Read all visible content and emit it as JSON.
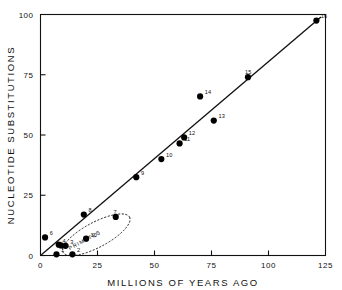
{
  "chart_data": {
    "type": "scatter",
    "title": "",
    "xlabel": "MILLIONS OF YEARS AGO",
    "ylabel": "NUCLEOTIDE SUBSTITUTIONS",
    "xlim": [
      0,
      125
    ],
    "ylim": [
      0,
      100
    ],
    "xticks": [
      0,
      25,
      50,
      75,
      100,
      125
    ],
    "yticks": [
      0,
      25,
      50,
      75,
      100
    ],
    "xtick_labels": [
      "0",
      "25",
      "50",
      "75",
      "100",
      "125"
    ],
    "ytick_labels": [
      "0",
      "25",
      "50",
      "75",
      "100"
    ],
    "grid": false,
    "legend": "none",
    "points": [
      {
        "label": "1",
        "x": 7,
        "y": 0.5,
        "label_dx": 3.0,
        "label_dy": -2.0
      },
      {
        "label": "2",
        "x": 14,
        "y": 0.5,
        "label_dx": 3.0,
        "label_dy": -2.0
      },
      {
        "label": "3",
        "x": 11,
        "y": 4.0,
        "label_dx": 3.0,
        "label_dy": -1.5
      },
      {
        "label": "4",
        "x": 8,
        "y": 4.5,
        "label_dx": 2.5,
        "label_dy": -2.0
      },
      {
        "label": "5",
        "x": 9,
        "y": 4.2,
        "label_dx": 2.5,
        "label_dy": 2.6
      },
      {
        "label": "6",
        "x": 2,
        "y": 7.5,
        "label_dx": 3.0,
        "label_dy": -2.2
      },
      {
        "label": "7",
        "x": 33,
        "y": 16.0,
        "label_dx": -1.5,
        "label_dy": -3.0
      },
      {
        "label": "8",
        "x": 19,
        "y": 17.0,
        "label_dx": 3.0,
        "label_dy": -2.4
      },
      {
        "label": "9",
        "x": 42,
        "y": 32.5,
        "label_dx": 3.0,
        "label_dy": -2.4
      },
      {
        "label": "10",
        "x": 53,
        "y": 40.0,
        "label_dx": 3.0,
        "label_dy": -2.4
      },
      {
        "label": "11",
        "x": 61,
        "y": 46.5,
        "label_dx": 3.0,
        "label_dy": -2.4
      },
      {
        "label": "12",
        "x": 63,
        "y": 49.0,
        "label_dx": 3.0,
        "label_dy": -2.4
      },
      {
        "label": "13",
        "x": 76,
        "y": 56.0,
        "label_dx": 3.0,
        "label_dy": -2.4
      },
      {
        "label": "14",
        "x": 70,
        "y": 66.0,
        "label_dx": 3.0,
        "label_dy": -2.4
      },
      {
        "label": "15",
        "x": 91,
        "y": 74.0,
        "label_dx": -2.0,
        "label_dy": -3.2
      },
      {
        "label": "16",
        "x": 121,
        "y": 97.5,
        "label_dx": 2.8,
        "label_dy": -2.2
      },
      {
        "label": "10",
        "x": 20,
        "y": 7.0,
        "label_dx": 2.8,
        "label_dy": -1.8
      }
    ],
    "regression_line": {
      "x0": 0,
      "y0": 0,
      "x1": 123,
      "y1": 99,
      "description": "linear fit through origin"
    },
    "annotations": [
      {
        "text": "PRIMATES",
        "type": "dashed-ellipse-group",
        "center_x": 24.5,
        "center_y": 8.6,
        "rx": 16.5,
        "ry": 5.2,
        "rotation_deg": -28
      }
    ]
  },
  "axis": {
    "x_title": "MILLIONS OF YEARS AGO",
    "y_title": "NUCLEOTIDE SUBSTITUTIONS"
  },
  "colors": {
    "ink": "#111111",
    "background": "#ffffff",
    "marker": "#000000"
  }
}
